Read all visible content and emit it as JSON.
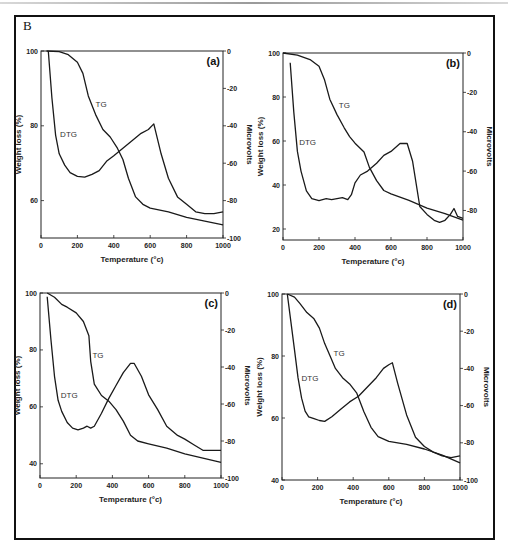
{
  "figure": {
    "label": "B"
  },
  "chart_data": [
    {
      "type": "line",
      "panel": "(a)",
      "xlabel": "Temperature (°c)",
      "ylabel": "Weight loss (%)",
      "y2label": "Microvolts",
      "xlim": [
        0,
        1000
      ],
      "ylim": [
        50,
        100
      ],
      "y2lim": [
        -100,
        0
      ],
      "xticks": [
        0,
        200,
        400,
        600,
        800,
        1000
      ],
      "yticks": [
        60,
        80,
        100
      ],
      "y2ticks": [
        0,
        -20,
        -40,
        -60,
        -80,
        -100
      ],
      "grid": false,
      "box": {
        "x0": 41,
        "y0": 51,
        "x1": 223,
        "y1": 238
      },
      "curve_labels": [
        {
          "text": "TG",
          "x": 300,
          "y": 85
        },
        {
          "text": "DTG",
          "x": 105,
          "y": 77
        }
      ],
      "series": [
        {
          "name": "TG",
          "axis": "left",
          "x": [
            30,
            100,
            150,
            200,
            230,
            260,
            300,
            340,
            380,
            420,
            450,
            480,
            520,
            560,
            600,
            700,
            800,
            900,
            1000
          ],
          "values": [
            100,
            99.8,
            99,
            97,
            94,
            88,
            83,
            79,
            77,
            74,
            71,
            66,
            61,
            59,
            58,
            57,
            55.5,
            54.5,
            53.5
          ]
        },
        {
          "name": "DTG",
          "axis": "right",
          "x": [
            40,
            60,
            80,
            100,
            130,
            160,
            200,
            240,
            280,
            320,
            360,
            400,
            450,
            500,
            550,
            590,
            620,
            660,
            700,
            750,
            800,
            850,
            900,
            950,
            1000
          ],
          "values": [
            0,
            -25,
            -45,
            -55,
            -61,
            -65,
            -67,
            -67.5,
            -66,
            -64,
            -59,
            -56,
            -52,
            -48,
            -44,
            -42,
            -39,
            -55,
            -68,
            -78,
            -82,
            -86,
            -87,
            -87,
            -86
          ]
        }
      ]
    },
    {
      "type": "line",
      "panel": "(b)",
      "xlabel": "Temperature (°c)",
      "ylabel": "Weight loss (%)",
      "y2label": "Microvolts",
      "xlim": [
        0,
        1000
      ],
      "ylim": [
        15,
        100
      ],
      "y2lim": [
        -95,
        0
      ],
      "xticks": [
        0,
        200,
        400,
        600,
        800,
        1000
      ],
      "yticks": [
        20,
        40,
        60,
        80,
        100
      ],
      "y2ticks": [
        0,
        -20,
        -40,
        -60,
        -80
      ],
      "grid": false,
      "box": {
        "x0": 283,
        "y0": 53,
        "x1": 463,
        "y1": 240
      },
      "curve_labels": [
        {
          "text": "TG",
          "x": 310,
          "y": 75
        },
        {
          "text": "DTG",
          "x": 90,
          "y": 58
        }
      ],
      "series": [
        {
          "name": "TG",
          "axis": "left",
          "x": [
            0,
            80,
            150,
            200,
            230,
            260,
            300,
            340,
            370,
            400,
            450,
            480,
            520,
            560,
            600,
            700,
            800,
            900,
            1000
          ],
          "values": [
            100,
            99,
            97,
            94,
            88,
            79,
            72,
            66,
            62,
            59,
            55,
            48,
            42,
            37.5,
            36,
            33,
            29.5,
            27,
            24
          ]
        },
        {
          "name": "DTG",
          "axis": "right",
          "x": [
            40,
            60,
            80,
            100,
            130,
            160,
            200,
            240,
            270,
            300,
            330,
            360,
            380,
            400,
            430,
            470,
            520,
            560,
            600,
            650,
            690,
            720,
            760,
            800,
            840,
            870,
            900,
            930,
            950,
            970,
            1000
          ],
          "values": [
            -5,
            -30,
            -50,
            -60,
            -70,
            -74,
            -75,
            -74,
            -74.5,
            -74,
            -73.5,
            -74.5,
            -72,
            -66,
            -62,
            -60,
            -56,
            -52,
            -50,
            -46,
            -46,
            -55,
            -78,
            -82,
            -85,
            -86,
            -85,
            -82,
            -79,
            -83,
            -84
          ]
        }
      ]
    },
    {
      "type": "line",
      "panel": "(c)",
      "xlabel": "Temperature (°c)",
      "ylabel": "Weight loss (%)",
      "y2label": "Microvolts",
      "xlim": [
        0,
        1000
      ],
      "ylim": [
        35,
        100
      ],
      "y2lim": [
        -100,
        0
      ],
      "xticks": [
        0,
        200,
        400,
        600,
        800,
        1000
      ],
      "yticks": [
        40,
        60,
        80,
        100
      ],
      "y2ticks": [
        0,
        -20,
        -40,
        -60,
        -80,
        -100
      ],
      "grid": false,
      "box": {
        "x0": 40,
        "y0": 293,
        "x1": 221,
        "y1": 478
      },
      "curve_labels": [
        {
          "text": "TG",
          "x": 290,
          "y": 77
        },
        {
          "text": "DTG",
          "x": 115,
          "y": 63
        }
      ],
      "series": [
        {
          "name": "TG",
          "axis": "left",
          "x": [
            40,
            80,
            120,
            150,
            200,
            240,
            270,
            280,
            300,
            340,
            380,
            420,
            460,
            500,
            540,
            600,
            700,
            800,
            900,
            1000
          ],
          "values": [
            100,
            98.5,
            96,
            95,
            93,
            90,
            85,
            76,
            68,
            64,
            62,
            59,
            55,
            50,
            48,
            47,
            45.5,
            43.5,
            42,
            40.5
          ]
        },
        {
          "name": "DTG",
          "axis": "right",
          "x": [
            40,
            60,
            80,
            100,
            120,
            150,
            180,
            210,
            240,
            260,
            280,
            300,
            340,
            380,
            420,
            460,
            500,
            520,
            560,
            600,
            650,
            700,
            760,
            800,
            850,
            900,
            950,
            1000
          ],
          "values": [
            -2,
            -25,
            -45,
            -58,
            -64,
            -70,
            -73,
            -74,
            -73,
            -72,
            -73,
            -72,
            -65,
            -57,
            -50,
            -43,
            -38,
            -38,
            -45,
            -55,
            -63,
            -72,
            -77,
            -79,
            -82,
            -85,
            -85,
            -85
          ]
        }
      ]
    },
    {
      "type": "line",
      "panel": "(d)",
      "xlabel": "Temperature (°c)",
      "ylabel": "Weight loss (%)",
      "y2label": "Microvolts",
      "xlim": [
        0,
        1000
      ],
      "ylim": [
        40,
        100
      ],
      "y2lim": [
        -100,
        0
      ],
      "xticks": [
        0,
        200,
        400,
        600,
        800,
        1000
      ],
      "yticks": [
        40,
        60,
        80,
        100
      ],
      "y2ticks": [
        0,
        -20,
        -40,
        -60,
        -80,
        -100
      ],
      "grid": false,
      "box": {
        "x0": 282,
        "y0": 294,
        "x1": 460,
        "y1": 480
      },
      "curve_labels": [
        {
          "text": "TG",
          "x": 290,
          "y": 80
        },
        {
          "text": "DTG",
          "x": 110,
          "y": 72
        }
      ],
      "series": [
        {
          "name": "TG",
          "axis": "left",
          "x": [
            30,
            70,
            100,
            140,
            180,
            210,
            240,
            270,
            300,
            340,
            380,
            420,
            460,
            500,
            540,
            600,
            700,
            800,
            900,
            1000
          ],
          "values": [
            100,
            99,
            97,
            94,
            92,
            89,
            84,
            80,
            76,
            73,
            71,
            68,
            62,
            57,
            54,
            52.5,
            51.5,
            50,
            48,
            45.5
          ]
        },
        {
          "name": "DTG",
          "axis": "right",
          "x": [
            30,
            50,
            70,
            90,
            110,
            130,
            150,
            180,
            210,
            240,
            280,
            330,
            380,
            430,
            480,
            530,
            570,
            600,
            620,
            650,
            700,
            750,
            800,
            850,
            900,
            950,
            1000
          ],
          "values": [
            0,
            -15,
            -30,
            -45,
            -56,
            -63,
            -66,
            -67,
            -68,
            -68.5,
            -66,
            -62,
            -58,
            -55,
            -50,
            -45,
            -40,
            -38,
            -37,
            -48,
            -65,
            -77,
            -82,
            -85,
            -87,
            -88,
            -87
          ]
        }
      ]
    }
  ]
}
